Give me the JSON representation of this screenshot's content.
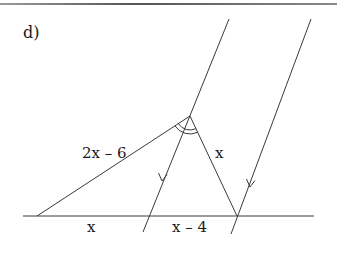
{
  "problem": {
    "part_label": "d)"
  },
  "labels": {
    "side_left": "2x – 6",
    "side_right": "x",
    "base_left": "x",
    "base_right": "x – 4"
  },
  "geometry": {
    "apex": [
      190,
      116
    ],
    "left_vertex": [
      37,
      216
    ],
    "right_vertex": [
      237,
      216
    ],
    "baseline": {
      "y": 216,
      "x_start": 23,
      "x_end": 314
    },
    "parallel_line_middle": {
      "top": [
        229,
        19
      ],
      "bottom": [
        143,
        232
      ]
    },
    "parallel_line_right": {
      "top": [
        311,
        19
      ],
      "bottom": [
        231,
        234
      ]
    },
    "angle_bisected_at": "apex",
    "angle_marks": "double-arc",
    "parallel_marks": "single-arrow"
  },
  "colors": {
    "line": "#3a3a3a",
    "text": "#1a1a1a",
    "rule": "#6b6b6b"
  }
}
